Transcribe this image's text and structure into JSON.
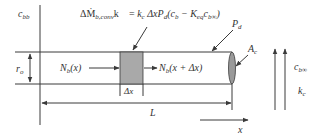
{
  "diagram": {
    "type": "cylindrical fiber mass balance schematic",
    "colors": {
      "line": "#3a3a3a",
      "element_fill": "#a9a9a9",
      "end_cap_fill": "#9a9a9a",
      "text": "#333333"
    },
    "labels": {
      "bulk_concentration": {
        "main": "c",
        "sub": "bb"
      },
      "radius": {
        "main": "r",
        "sub": "o"
      },
      "flux_in": {
        "main": "N",
        "sub": "b",
        "arg": "(x)"
      },
      "flux_out": {
        "main": "N",
        "sub": "b",
        "arg": "(x + Δx)"
      },
      "element_width": "Δx",
      "length": "L",
      "axis": "x",
      "perimeter": {
        "main": "P",
        "sub": "d"
      },
      "cross_section_area": {
        "main": "A",
        "sub": "c"
      },
      "far_concentration": {
        "main": "c",
        "sub": "b∞"
      },
      "mass_transfer_coefficient": {
        "main": "k",
        "sub": "c"
      },
      "equation": {
        "lhs_main": "ΔṀ",
        "lhs_sub": "b,conv",
        "rhs": "= k_c Δx P_d (c_b − K_eq c_b∞)",
        "rhs_parts": {
          "k": "k",
          "k_sub": "c",
          "dx": " ΔxP",
          "p_sub": "d",
          "open": "(c",
          "cb_sub": "b",
          "minus": " − K",
          "keq_sub": "eq",
          "c2": "c",
          "cinf_sub": "b∞",
          "close": ")"
        }
      }
    }
  }
}
